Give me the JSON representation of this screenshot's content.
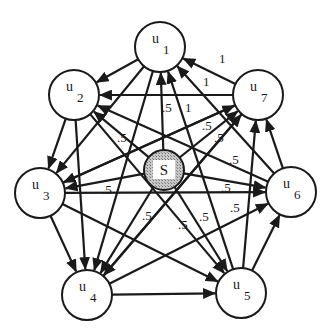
{
  "diagram": {
    "title": "",
    "source_node": {
      "id": "S",
      "label": "S",
      "x": 164,
      "y": 170,
      "r": 20
    },
    "nodes": [
      {
        "id": "u1",
        "base": "u",
        "sub": "1",
        "x": 160,
        "y": 47
      },
      {
        "id": "u2",
        "base": "u",
        "sub": "2",
        "x": 74,
        "y": 95
      },
      {
        "id": "u3",
        "base": "u",
        "sub": "3",
        "x": 40,
        "y": 193
      },
      {
        "id": "u4",
        "base": "u",
        "sub": "4",
        "x": 87,
        "y": 295
      },
      {
        "id": "u5",
        "base": "u",
        "sub": "5",
        "x": 241,
        "y": 293
      },
      {
        "id": "u6",
        "base": "u",
        "sub": "6",
        "x": 291,
        "y": 192
      },
      {
        "id": "u7",
        "base": "u",
        "sub": "7",
        "x": 258,
        "y": 95
      }
    ],
    "node_radius": 25,
    "edges": [
      {
        "from": "u1",
        "to": "u2"
      },
      {
        "from": "u1",
        "to": "u3"
      },
      {
        "from": "u1",
        "to": "u4"
      },
      {
        "from": "u7",
        "to": "u1",
        "label": "1"
      },
      {
        "from": "u7",
        "to": "u2"
      },
      {
        "from": "u7",
        "to": "u3"
      },
      {
        "from": "u7",
        "to": "u4"
      },
      {
        "from": "u6",
        "to": "u1",
        "label": "1"
      },
      {
        "from": "u5",
        "to": "u1",
        "label": "1"
      },
      {
        "from": "u6",
        "to": "u2",
        "label": ".5"
      },
      {
        "from": "u2",
        "to": "u3"
      },
      {
        "from": "u2",
        "to": "u4"
      },
      {
        "from": "u2",
        "to": "u5"
      },
      {
        "from": "u3",
        "to": "u4"
      },
      {
        "from": "u3",
        "to": "u5"
      },
      {
        "from": "u3",
        "to": "u6"
      },
      {
        "from": "u3",
        "to": "u7"
      },
      {
        "from": "u4",
        "to": "u5"
      },
      {
        "from": "u4",
        "to": "u6"
      },
      {
        "from": "u4",
        "to": "u7"
      },
      {
        "from": "u5",
        "to": "u6"
      },
      {
        "from": "u5",
        "to": "u7"
      },
      {
        "from": "u6",
        "to": "u7"
      },
      {
        "from": "S",
        "to": "u1",
        "label": ".5"
      },
      {
        "from": "S",
        "to": "u2",
        "label": ".5"
      },
      {
        "from": "S",
        "to": "u3",
        "label": ".5"
      },
      {
        "from": "S",
        "to": "u4",
        "label": ".5"
      },
      {
        "from": "S",
        "to": "u5",
        "label": ".5"
      },
      {
        "from": "S",
        "to": "u6",
        "label": ".5"
      },
      {
        "from": "S",
        "to": "u7",
        "label": ".5"
      }
    ],
    "edge_labels": [
      {
        "text": "1",
        "x": 219,
        "y": 63
      },
      {
        "text": "1",
        "x": 203,
        "y": 86
      },
      {
        "text": ".5",
        "x": 162,
        "y": 112
      },
      {
        "text": "1",
        "x": 185,
        "y": 112
      },
      {
        "text": ".5",
        "x": 117,
        "y": 142
      },
      {
        "text": ".5",
        "x": 202,
        "y": 130
      },
      {
        "text": ".5",
        "x": 214,
        "y": 142
      },
      {
        "text": ".5",
        "x": 229,
        "y": 164
      },
      {
        "text": ".5",
        "x": 102,
        "y": 194
      },
      {
        "text": ".5",
        "x": 221,
        "y": 192
      },
      {
        "text": ".5",
        "x": 230,
        "y": 212
      },
      {
        "text": ".5",
        "x": 142,
        "y": 220
      },
      {
        "text": ".5",
        "x": 178,
        "y": 229
      },
      {
        "text": ".5",
        "x": 199,
        "y": 221
      }
    ]
  }
}
